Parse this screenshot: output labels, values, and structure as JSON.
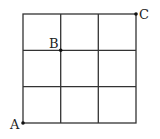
{
  "diagram": {
    "type": "grid",
    "rows": 3,
    "cols": 3,
    "line_color": "#333333",
    "points": [
      {
        "label": "A",
        "position": "bottom-left corner"
      },
      {
        "label": "B",
        "position": "grid intersection (1 right, 1 down from top-left)"
      },
      {
        "label": "C",
        "position": "top-right corner"
      }
    ]
  }
}
